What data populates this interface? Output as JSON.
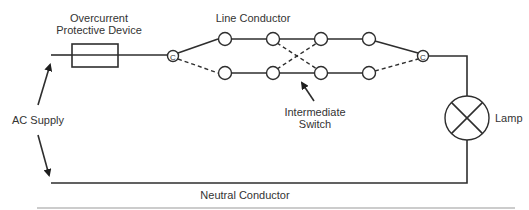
{
  "diagram": {
    "labels": {
      "ocpd_line1": "Overcurrent",
      "ocpd_line2": "Protective Device",
      "line_conductor": "Line Conductor",
      "ac_supply": "AC Supply",
      "intermediate_line1": "Intermediate",
      "intermediate_line2": "Switch",
      "lamp": "Lamp",
      "neutral_conductor": "Neutral Conductor",
      "terminal_left": "C",
      "terminal_right": "C"
    },
    "components": [
      {
        "id": "fuse",
        "type": "overcurrent-protective-device"
      },
      {
        "id": "two-way-switch-left",
        "type": "two-way-switch",
        "common": "C"
      },
      {
        "id": "intermediate-switch-1",
        "type": "intermediate-switch"
      },
      {
        "id": "intermediate-switch-2",
        "type": "intermediate-switch"
      },
      {
        "id": "two-way-switch-right",
        "type": "two-way-switch",
        "common": "C"
      },
      {
        "id": "lamp",
        "type": "lamp"
      }
    ],
    "colors": {
      "stroke": "#2e2e2e",
      "text": "#333333",
      "rule": "#9a9a9a",
      "background": "#ffffff"
    }
  }
}
